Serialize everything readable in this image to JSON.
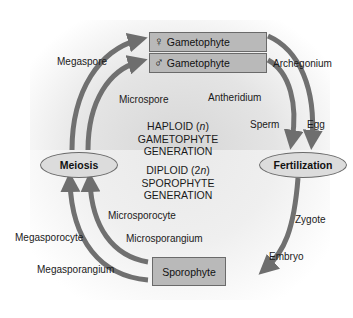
{
  "diagram": {
    "boxes": {
      "female_gametophyte": {
        "symbol": "♀",
        "label": "Gametophyte"
      },
      "male_gametophyte": {
        "symbol": "♂",
        "label": "Gametophyte"
      },
      "sporophyte": {
        "label": "Sporophyte"
      }
    },
    "ovals": {
      "meiosis": "Meiosis",
      "fertilization": "Fertilization"
    },
    "generations": {
      "haploid": {
        "line1_prefix": "HAPLOID (",
        "line1_var": "n",
        "line1_suffix": ")",
        "line2": "GAMETOPHYTE",
        "line3": "GENERATION"
      },
      "diploid": {
        "line1_prefix": "DIPLOID (2",
        "line1_var": "n",
        "line1_suffix": ")",
        "line2": "SPOROPHYTE",
        "line3": "GENERATION"
      }
    },
    "labels": {
      "megaspore": "Megaspore",
      "microspore": "Microspore",
      "archegonium": "Archegonium",
      "antheridium": "Antheridium",
      "sperm": "Sperm",
      "egg": "Egg",
      "zygote": "Zygote",
      "embryo": "Embryo",
      "microsporocyte": "Microsporocyte",
      "megasporocyte": "Megasporocyte",
      "microsporangium": "Microsporangium",
      "megasporangium": "Megasporangium"
    },
    "colors": {
      "arrow": "#6e6e6e",
      "box_fill": "#b9b9b9",
      "oval_fill": "#dcdcdc",
      "haploid_bg": "#e0e0e0",
      "diploid_bg": "#efefef"
    }
  }
}
